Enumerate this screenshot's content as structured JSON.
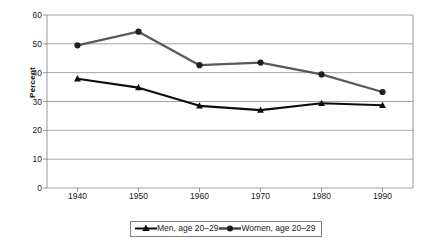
{
  "chart_data": {
    "type": "line",
    "title": "",
    "xlabel": "",
    "ylabel": "Percent",
    "x": [
      1940,
      1950,
      1960,
      1970,
      1980,
      1990
    ],
    "categories": [
      "1940",
      "1950",
      "1960",
      "1970",
      "1980",
      "1990"
    ],
    "series": [
      {
        "name": "Men, age 20–29",
        "values": [
          37.9,
          34.8,
          28.5,
          27.0,
          29.4,
          28.7
        ],
        "color": "#0d0d0d",
        "marker": "triangle"
      },
      {
        "name": "Women, age 20–29",
        "values": [
          49.5,
          54.2,
          42.6,
          43.5,
          39.4,
          33.3
        ],
        "color": "#595959",
        "marker": "circle"
      }
    ],
    "ylim": [
      0,
      60
    ],
    "ytick_labels": [
      "0",
      "10",
      "20",
      "30",
      "40",
      "50",
      "60"
    ],
    "yticks": [
      0,
      10,
      20,
      30,
      40,
      50,
      60
    ],
    "grid": "horizontal",
    "legend_position": "bottom"
  },
  "legend": {
    "entries": [
      {
        "label": "Men, age 20–29"
      },
      {
        "label": "Women, age 20–29"
      }
    ]
  }
}
